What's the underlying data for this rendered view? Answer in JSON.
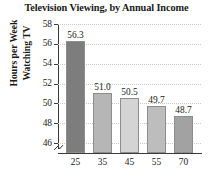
{
  "chart_data": {
    "type": "bar",
    "title": "Television Viewing, by Annual Income",
    "xlabel": "",
    "ylabel": "Hours per Week Watching TV",
    "ylabel_lines": [
      "Hours per Week",
      "Watching TV"
    ],
    "categories": [
      "25",
      "35",
      "45",
      "55",
      "70"
    ],
    "values": [
      56.3,
      51.0,
      50.5,
      49.7,
      48.7
    ],
    "value_labels": [
      "56.3",
      "51.0",
      "50.5",
      "49.7",
      "48.7"
    ],
    "ylim": [
      45,
      58
    ],
    "yticks": [
      58,
      56,
      54,
      52,
      50,
      48,
      46
    ],
    "ytick_labels": [
      "58",
      "56",
      "54",
      "52",
      "50",
      "48",
      "46"
    ],
    "grid": true,
    "grid_axis": "y",
    "legend": null,
    "axis_break": true,
    "bar_colors": [
      "#7d7d7d",
      "#b6b6b6",
      "#d4d4d4",
      "#bdbdbd",
      "#a2a2a2"
    ],
    "series": [
      {
        "name": "Hours per Week Watching TV",
        "values": [
          56.3,
          51.0,
          50.5,
          49.7,
          48.7
        ]
      }
    ]
  }
}
